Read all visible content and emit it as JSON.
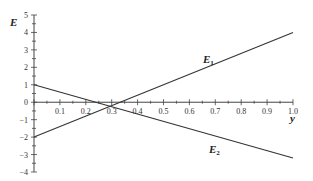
{
  "chart_data": {
    "type": "line",
    "title": "",
    "xlabel": "y",
    "ylabel": "E",
    "xlim": [
      0,
      1.0
    ],
    "ylim": [
      -4,
      5
    ],
    "x_ticks": [
      "0.1",
      "0.2",
      "0.3",
      "0.4",
      "0.5",
      "0.6",
      "0.7",
      "0.8",
      "0.9",
      "1.0"
    ],
    "y_ticks": [
      "5",
      "4",
      "3",
      "2",
      "1",
      "0",
      "-1",
      "-2",
      "-3",
      "-4"
    ],
    "grid": false,
    "legend": "inline labels",
    "series": [
      {
        "name": "E1",
        "label_main": "E",
        "label_sub": "1",
        "x": [
          0,
          1.0
        ],
        "values": [
          -2,
          4
        ]
      },
      {
        "name": "E2",
        "label_main": "E",
        "label_sub": "2",
        "x": [
          0,
          1.0
        ],
        "values": [
          1,
          -3.2
        ]
      }
    ],
    "intersection": {
      "x": 0.29,
      "y": -0.24
    }
  },
  "colors": {
    "axis": "#444444",
    "line": "#333333",
    "text": "#222222"
  }
}
